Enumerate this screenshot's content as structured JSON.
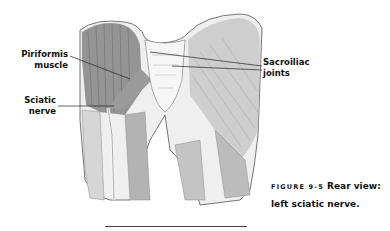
{
  "figure": {
    "number_label": "FIGURE 9-5",
    "title": "Rear view:",
    "subtitle": "left sciatic nerve."
  },
  "labels": {
    "piriformis": [
      "Piriformis",
      "muscle"
    ],
    "sciatic": [
      "Sciatic",
      "nerve"
    ],
    "sacroiliac": [
      "Sacroiliac",
      "joints"
    ]
  },
  "colors": {
    "muscle_dark": "#7a7a7a",
    "muscle_mid": "#a9a9a9",
    "muscle_light": "#d2d2d2",
    "outline": "#444444",
    "text": "#111111"
  }
}
